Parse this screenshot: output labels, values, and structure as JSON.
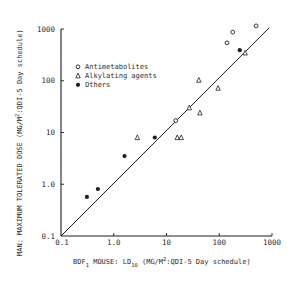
{
  "chart_data": {
    "type": "scatter",
    "title": "",
    "xlabel": "BDF1 MOUSE: LD10 (MG/M2:QDI-5 Day schedule)",
    "xlabel_parts": {
      "pre": "BDF",
      "sub1": "1",
      "mid": " MOUSE: LD",
      "sub2": "10",
      "post1": " (MG/M",
      "sup": "2",
      "post2": ":QDI-5 Day schedule)"
    },
    "ylabel": "MAN: MAXIMUM TOLERATED DOSE (MG/M2:QDI-5 Day schedule)",
    "ylabel_parts": {
      "pre": "MAN: MAXIMUM TOLERATED DOSE (MG/M",
      "sup": "2",
      "post": ":QDI-5 Day schedule)"
    },
    "xscale": "log",
    "yscale": "log",
    "xlim": [
      0.1,
      1000
    ],
    "ylim": [
      0.1,
      1000
    ],
    "x_ticks": [
      0.1,
      1,
      10,
      100,
      1000
    ],
    "x_tick_labels": [
      "0.1",
      "1.0",
      "10",
      "100",
      "1000"
    ],
    "y_ticks": [
      0.1,
      1,
      10,
      100,
      1000
    ],
    "y_tick_labels": [
      "0.1",
      "1.0",
      "10",
      "100",
      "1000"
    ],
    "grid": false,
    "legend_position": "upper left",
    "series": [
      {
        "name": "Antimetabolites",
        "marker": "open-circle",
        "points": [
          [
            180,
            870
          ],
          [
            500,
            1150
          ],
          [
            140,
            540
          ],
          [
            15,
            17
          ]
        ]
      },
      {
        "name": "Alkylating agents",
        "marker": "open-triangle",
        "points": [
          [
            310,
            345
          ],
          [
            41,
            103
          ],
          [
            95,
            72
          ],
          [
            27,
            30
          ],
          [
            43,
            24
          ],
          [
            2.8,
            8
          ],
          [
            16,
            8
          ],
          [
            19,
            8
          ]
        ]
      },
      {
        "name": "Others",
        "marker": "filled-circle",
        "points": [
          [
            245,
            390
          ],
          [
            6.0,
            8
          ],
          [
            1.6,
            3.5
          ],
          [
            0.5,
            0.81
          ],
          [
            0.31,
            0.57
          ]
        ]
      }
    ],
    "reference_line": {
      "type": "regression",
      "from": [
        0.1,
        0.1
      ],
      "to": [
        880,
        1050
      ]
    }
  }
}
